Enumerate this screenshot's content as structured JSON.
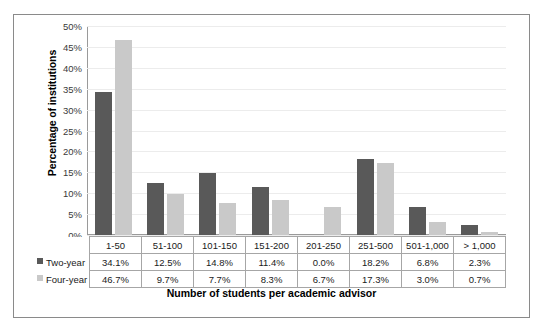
{
  "chart_data": {
    "type": "bar",
    "title": "",
    "xlabel": "Number of students per academic advisor",
    "ylabel": "Percentage of institutions",
    "categories": [
      "1-50",
      "51-100",
      "101-150",
      "151-200",
      "201-250",
      "251-500",
      "501-1,000",
      "> 1,000"
    ],
    "series": [
      {
        "name": "Two-year",
        "color": "#595959",
        "values": [
          34.1,
          12.5,
          14.8,
          11.4,
          0.0,
          18.2,
          6.8,
          2.3
        ],
        "labels": [
          "34.1%",
          "12.5%",
          "14.8%",
          "11.4%",
          "0.0%",
          "18.2%",
          "6.8%",
          "2.3%"
        ]
      },
      {
        "name": "Four-year",
        "color": "#c9c9c9",
        "values": [
          46.7,
          9.7,
          7.7,
          8.3,
          6.7,
          17.3,
          3.0,
          0.7
        ],
        "labels": [
          "46.7%",
          "9.7%",
          "7.7%",
          "8.3%",
          "6.7%",
          "17.3%",
          "3.0%",
          "0.7%"
        ]
      }
    ],
    "ylim": [
      0,
      50
    ],
    "yticks": [
      50,
      45,
      40,
      35,
      30,
      25,
      20,
      15,
      10,
      5,
      0
    ],
    "yticklabels": [
      "50%",
      "45%",
      "40%",
      "35%",
      "30%",
      "25%",
      "20%",
      "15%",
      "10%",
      "5%",
      "0%"
    ],
    "grid": true,
    "legend_position": "data-table-row-headers"
  }
}
